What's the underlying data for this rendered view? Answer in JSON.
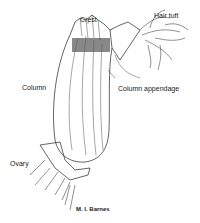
{
  "labels": {
    "crest": "Crest",
    "hair_tuft": "Hair tuft",
    "column": "Column",
    "column_appendage": "Column appendage",
    "ovary": "Ovary"
  },
  "credit": "M. I. Barnes",
  "colors": {
    "ink": "#222222",
    "background": "#ffffff"
  }
}
